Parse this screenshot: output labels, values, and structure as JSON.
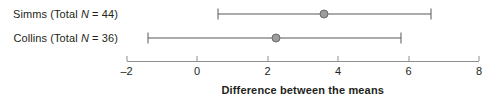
{
  "chart_data": {
    "type": "scatter",
    "title": "",
    "xlabel": "Difference between the means",
    "ylabel": "",
    "xlim": [
      -2,
      8
    ],
    "xticks": [
      -2,
      0,
      2,
      4,
      6,
      8
    ],
    "xtick_labels": [
      "–2",
      "0",
      "2",
      "4",
      "6",
      "8"
    ],
    "grid": false,
    "legend": "none",
    "orientation": "horizontal",
    "annotation": "Forest plot of mean differences with 95% confidence intervals",
    "series": [
      {
        "name": "Simms",
        "label_prefix": "Simms (Total ",
        "label_italic": "N",
        "label_suffix": " = 44)",
        "total_n": 44,
        "estimate": 3.6,
        "ci_low": 0.6,
        "ci_high": 6.65
      },
      {
        "name": "Collins",
        "label_prefix": "Collins (Total ",
        "label_italic": "N",
        "label_suffix": " = 36)",
        "total_n": 36,
        "estimate": 2.25,
        "ci_low": -1.4,
        "ci_high": 5.8
      }
    ]
  },
  "colors": {
    "line": "#58595b",
    "marker_fill": "#9d9d9f",
    "marker_edge": "#6a6b6d",
    "axis": "#8c8d8f",
    "text": "#231f20"
  }
}
